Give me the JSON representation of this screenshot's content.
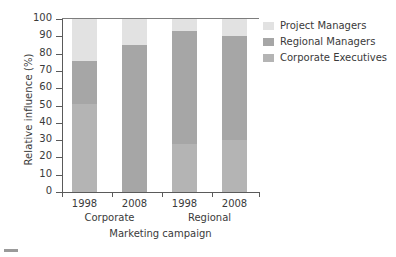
{
  "chart_data": {
    "type": "bar",
    "subtype": "stacked-bar",
    "title": "",
    "xlabel": "Marketing campaign",
    "ylabel": "Relative influence (%)",
    "ylim": [
      0,
      100
    ],
    "ytick_values": [
      0,
      10,
      20,
      30,
      40,
      50,
      60,
      70,
      80,
      90,
      100
    ],
    "ytick_labels": [
      "0",
      "10",
      "20",
      "30",
      "40",
      "50",
      "60",
      "70",
      "80",
      "90",
      "100"
    ],
    "grid": false,
    "legend_position": "right",
    "categories": [
      "1998",
      "2008",
      "1998",
      "2008"
    ],
    "groups": [
      {
        "label": "Corporate",
        "categories": [
          "1998",
          "2008"
        ]
      },
      {
        "label": "Regional",
        "categories": [
          "1998",
          "2008"
        ]
      }
    ],
    "series": [
      {
        "name": "Corporate Executives",
        "color": "#b4b4b4",
        "values": [
          51,
          0,
          28,
          30
        ]
      },
      {
        "name": "Regional Managers",
        "color": "#a6a6a6",
        "values": [
          25,
          85,
          65,
          60
        ]
      },
      {
        "name": "Project Managers",
        "color": "#e2e2e2",
        "values": [
          24,
          15,
          7,
          10
        ]
      }
    ],
    "cumulative_tops": [
      {
        "category": "Corporate 1998",
        "corporate_executives_top": 51,
        "regional_managers_top": 76,
        "project_managers_top": 100
      },
      {
        "category": "Corporate 2008",
        "corporate_executives_top": 0,
        "regional_managers_top": 85,
        "project_managers_top": 100
      },
      {
        "category": "Regional 1998",
        "corporate_executives_top": 28,
        "regional_managers_top": 93,
        "project_managers_top": 100
      },
      {
        "category": "Regional 2008",
        "corporate_executives_top": 30,
        "regional_managers_top": 90,
        "project_managers_top": 100
      }
    ]
  },
  "legend": {
    "items": [
      {
        "label": "Project Managers",
        "color": "#e2e2e2"
      },
      {
        "label": "Regional Managers",
        "color": "#a6a6a6"
      },
      {
        "label": "Corporate Executives",
        "color": "#b4b4b4"
      }
    ]
  },
  "axes": {
    "y_title": "Relative influence (%)",
    "x_title": "Marketing campaign"
  }
}
